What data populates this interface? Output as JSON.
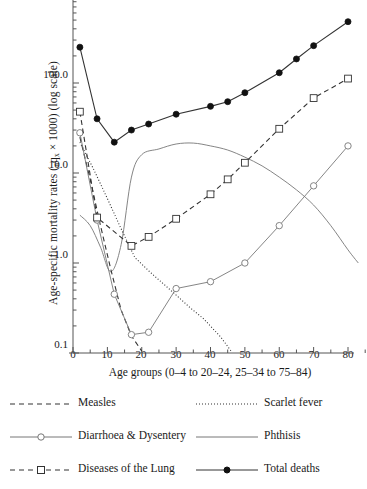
{
  "chart_data": {
    "type": "line",
    "title": "",
    "xlabel": "Age groups (0–4 to 20–24, 25–34 to 75–84)",
    "ylabel": "Age-specific mortality rates (nqx × 1000) (log scale)",
    "ylabel_prefix": "Age-specific mortality rates (",
    "ylabel_sub": "n",
    "ylabel_mid": "q",
    "ylabel_sub2": "x",
    "ylabel_suffix": " × 1000) (log scale)",
    "yscale": "log",
    "ylim": [
      0.1,
      1000
    ],
    "xlim": [
      0,
      85
    ],
    "grid": false,
    "legend_position": "below-plot",
    "yticks": [
      "0.1",
      "1.0",
      "10.0",
      "100.0"
    ],
    "ytick_values": [
      0.1,
      1.0,
      10.0,
      100.0
    ],
    "xticks": [
      "0",
      "10",
      "20",
      "30",
      "40",
      "50",
      "60",
      "70",
      "80"
    ],
    "xtick_values": [
      0,
      10,
      20,
      30,
      40,
      50,
      60,
      70,
      80
    ],
    "series": [
      {
        "name": "Total deaths",
        "style": "solid-filled-circle",
        "color": "#333333",
        "marker": "filled-circle",
        "x": [
          2,
          7,
          12,
          17,
          22,
          30,
          40,
          45,
          50,
          60,
          65,
          70,
          80
        ],
        "y": [
          250,
          40,
          22,
          30,
          35,
          45,
          55,
          62,
          78,
          130,
          185,
          260,
          480
        ]
      },
      {
        "name": "Diseases of the Lung",
        "style": "dashed-open-square",
        "color": "#333333",
        "marker": "open-square",
        "x": [
          2,
          7,
          17,
          22,
          30,
          40,
          45,
          50,
          60,
          70,
          80
        ],
        "y": [
          48,
          3.2,
          1.55,
          1.95,
          3.1,
          5.8,
          8.5,
          13.0,
          31.0,
          68.0,
          112.0
        ]
      },
      {
        "name": "Diarrhoea & Dysentery",
        "style": "solid-open-circle",
        "color": "#777777",
        "marker": "open-circle",
        "x": [
          2,
          7,
          12,
          17,
          22,
          30,
          40,
          50,
          60,
          70,
          80
        ],
        "y": [
          28.0,
          3.0,
          0.45,
          0.16,
          0.17,
          0.52,
          0.62,
          1.0,
          2.6,
          7.2,
          20.0
        ]
      },
      {
        "name": "Measles",
        "style": "dashed",
        "color": "#333333",
        "marker": "none",
        "x": [
          2,
          5,
          8,
          11,
          14,
          17,
          20
        ],
        "y": [
          25.0,
          8.5,
          2.6,
          0.85,
          0.3,
          0.155,
          0.105
        ]
      },
      {
        "name": "Scarlet fever",
        "style": "dotted",
        "color": "#333333",
        "marker": "none",
        "x": [
          2,
          6,
          10,
          14,
          18,
          22,
          26,
          30,
          34,
          38,
          43,
          46
        ],
        "y": [
          22.0,
          11.0,
          5.2,
          2.4,
          1.15,
          0.82,
          0.6,
          0.44,
          0.32,
          0.24,
          0.15,
          0.105
        ]
      },
      {
        "name": "Phthisis",
        "style": "solid-thin",
        "color": "#777777",
        "marker": "none",
        "x": [
          2,
          5,
          8,
          11,
          14,
          17,
          20,
          25,
          30,
          35,
          40,
          45,
          50,
          55,
          60,
          65,
          70,
          75,
          80,
          83
        ],
        "y": [
          3.4,
          2.6,
          1.5,
          0.8,
          1.6,
          9.0,
          16.0,
          18.5,
          21.0,
          21.5,
          20.0,
          18.0,
          15.0,
          12.0,
          9.0,
          6.5,
          4.4,
          2.6,
          1.4,
          1.0
        ]
      }
    ]
  },
  "legend": {
    "items": [
      {
        "label": "Measles",
        "sample": "dashed",
        "col": 0,
        "row": 0
      },
      {
        "label": "Scarlet fever",
        "sample": "dotted",
        "col": 1,
        "row": 0
      },
      {
        "label": "Diarrhoea & Dysentery",
        "sample": "solid-open-circle",
        "col": 0,
        "row": 1
      },
      {
        "label": "Phthisis",
        "sample": "solid-thin",
        "col": 1,
        "row": 1
      },
      {
        "label": "Diseases of the Lung",
        "sample": "dashed-open-square",
        "col": 0,
        "row": 2
      },
      {
        "label": "Total deaths",
        "sample": "solid-filled-circle",
        "col": 1,
        "row": 2
      }
    ]
  },
  "colors": {
    "axis": "#555555",
    "ink": "#1a1a1a",
    "grey_series": "#777777",
    "dark_series": "#333333",
    "background": "#ffffff"
  }
}
